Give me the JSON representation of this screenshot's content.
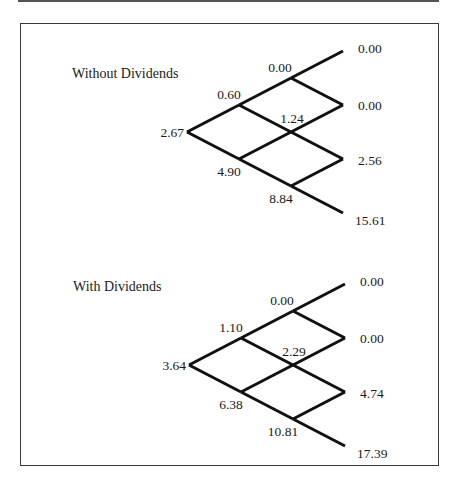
{
  "figure": {
    "colors": {
      "line": "#111111",
      "text": "#1a1a1a",
      "border": "#3a3a3a"
    },
    "trees": [
      {
        "title": "Without Dividends",
        "title_pos": [
          72,
          66
        ],
        "root": [
          187,
          132
        ],
        "dx": 52,
        "dy": 27,
        "nodes": {
          "n0_0": "2.67",
          "n1_up": "0.60",
          "n1_down": "4.90",
          "n2_upup": "0.00",
          "n2_mid": "1.24",
          "n2_downdown": "8.84",
          "n3_0": "0.00",
          "n3_1": "0.00",
          "n3_2": "2.56",
          "n3_3": "15.61"
        }
      },
      {
        "title": "With Dividends",
        "title_pos": [
          73,
          279
        ],
        "root": [
          189,
          365
        ],
        "dx": 52,
        "dy": 27,
        "nodes": {
          "n0_0": "3.64",
          "n1_up": "1.10",
          "n1_down": "6.38",
          "n2_upup": "0.00",
          "n2_mid": "2.29",
          "n2_downdown": "10.81",
          "n3_0": "0.00",
          "n3_1": "0.00",
          "n3_2": "4.74",
          "n3_3": "17.39"
        }
      }
    ]
  }
}
